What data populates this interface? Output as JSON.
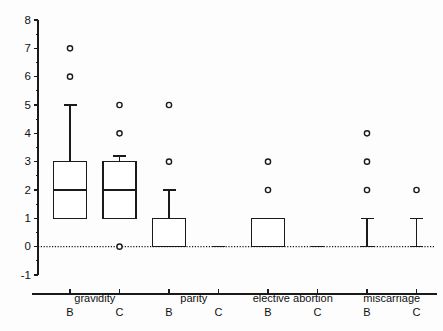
{
  "chart_data": {
    "type": "box",
    "title": "",
    "xlabel": "",
    "ylabel": "",
    "ylim": [
      -1,
      8
    ],
    "grid": false,
    "legend": "none",
    "zero_reference_line": true,
    "ytick_labels": [
      "8",
      "7",
      "6",
      "5",
      "4",
      "3",
      "2",
      "1",
      "0",
      "-1"
    ],
    "ytick_values": [
      8,
      7,
      6,
      5,
      4,
      3,
      2,
      1,
      0,
      -1
    ],
    "group_labels": [
      "gravidity",
      "parity",
      "elective abortion",
      "miscarriage"
    ],
    "categories": [
      "gravidity B",
      "gravidity C",
      "parity B",
      "parity C",
      "elective abortion B",
      "elective abortion C",
      "miscarriage B",
      "miscarriage C"
    ],
    "sub_labels": [
      "B",
      "C",
      "B",
      "C",
      "B",
      "C",
      "B",
      "C"
    ],
    "boxes": [
      {
        "category": "gravidity B",
        "group": "gravidity",
        "sub": "B",
        "whisker_low": 1,
        "q1": 1,
        "median": 2,
        "q3": 3,
        "whisker_high": 5,
        "outliers": [
          7,
          6
        ]
      },
      {
        "category": "gravidity C",
        "group": "gravidity",
        "sub": "C",
        "whisker_low": 1,
        "q1": 1,
        "median": 2,
        "q3": 3,
        "whisker_high": 3.2,
        "outliers": [
          5,
          4,
          0
        ]
      },
      {
        "category": "parity B",
        "group": "parity",
        "sub": "B",
        "whisker_low": 0,
        "q1": 0,
        "median": 0,
        "q3": 1,
        "whisker_high": 2,
        "outliers": [
          5,
          3
        ]
      },
      {
        "category": "parity C",
        "group": "parity",
        "sub": "C",
        "whisker_low": 0,
        "q1": 0,
        "median": 0,
        "q3": 0,
        "whisker_high": 0,
        "outliers": []
      },
      {
        "category": "elective abortion B",
        "group": "elective abortion",
        "sub": "B",
        "whisker_low": 0,
        "q1": 0,
        "median": 0,
        "q3": 1,
        "whisker_high": 1,
        "outliers": [
          3,
          2
        ]
      },
      {
        "category": "elective abortion C",
        "group": "elective abortion",
        "sub": "C",
        "whisker_low": 0,
        "q1": 0,
        "median": 0,
        "q3": 0,
        "whisker_high": 0,
        "outliers": []
      },
      {
        "category": "miscarriage B",
        "group": "miscarriage",
        "sub": "B",
        "whisker_low": 0,
        "q1": 0,
        "median": 0,
        "q3": 0,
        "whisker_high": 1,
        "outliers": [
          4,
          3,
          2
        ]
      },
      {
        "category": "miscarriage C",
        "group": "miscarriage",
        "sub": "C",
        "whisker_low": 0,
        "q1": 0,
        "median": 0,
        "q3": 0,
        "whisker_high": 1,
        "outliers": [
          2
        ]
      }
    ]
  },
  "style": {
    "line_color": "#1a1a1a",
    "box_fill": "#ffffff",
    "background": "#fdfdfd"
  }
}
